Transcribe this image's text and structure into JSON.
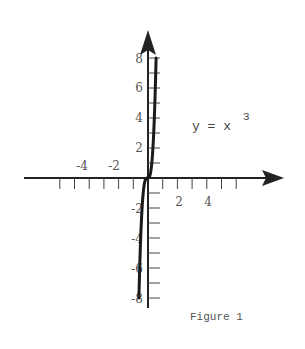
{
  "chart_data": {
    "type": "line",
    "title": "",
    "equation_label": "y = x",
    "equation_exponent": "3",
    "caption": "Figure 1",
    "xlabel": "",
    "ylabel": "",
    "x_tick_labels": [
      "-4",
      "-2",
      "2",
      "4"
    ],
    "y_tick_labels": [
      "8",
      "6",
      "4",
      "2",
      "-2",
      "-4",
      "-6",
      "-8"
    ],
    "xlim": [
      -6,
      8
    ],
    "ylim": [
      -9,
      9
    ],
    "grid": false,
    "legend": "none",
    "series": [
      {
        "name": "y = x^3",
        "x": [
          -2,
          -1.75,
          -1.5,
          -1.25,
          -1,
          -0.75,
          -0.5,
          -0.25,
          0,
          0.25,
          0.5,
          0.75,
          1,
          1.25,
          1.5,
          1.75,
          2
        ],
        "y": [
          -8,
          -5.36,
          -3.38,
          -1.95,
          -1,
          -0.42,
          -0.125,
          -0.016,
          0,
          0.016,
          0.125,
          0.42,
          1,
          1.95,
          3.38,
          5.36,
          8
        ]
      }
    ],
    "colors": {
      "axis": "#222222",
      "curve": "#1a1a1a",
      "text": "#555555"
    }
  }
}
